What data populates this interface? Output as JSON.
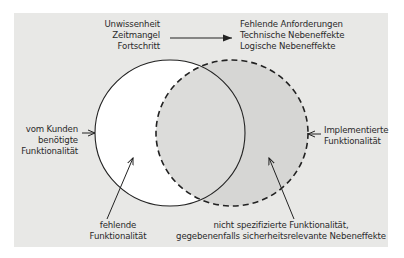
{
  "diagram": {
    "causes": [
      "Unwissenheit",
      "Zeitmangel",
      "Fortschritt"
    ],
    "effects": [
      "Fehlende Anforderungen",
      "Technische Nebeneffekte",
      "Logische Nebeneffekte"
    ],
    "required_label": [
      "vom Kunden",
      "benötigte",
      "Funktionalität"
    ],
    "implemented_label": [
      "Implementierte",
      "Funktionalität"
    ],
    "missing_label": [
      "fehlende",
      "Funktionalität"
    ],
    "unspecified_label": [
      "nicht spezifizierte Funktionalität,",
      "gegebenenfalls sicherheitsrelevante Nebeneffekte"
    ],
    "colors": {
      "background": "#e8e8e6",
      "required_fill": "#ffffff",
      "implemented_fill": "#d6d6d4",
      "stroke": "#222222"
    }
  }
}
